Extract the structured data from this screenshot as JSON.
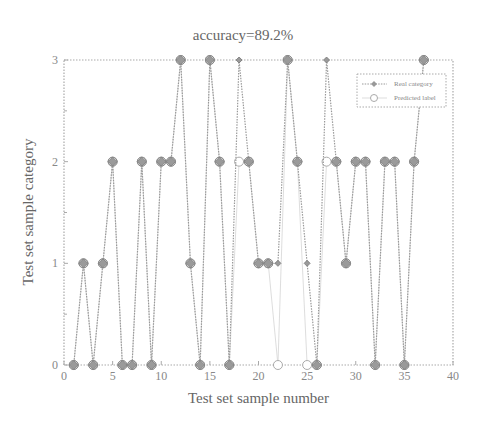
{
  "chart_data": {
    "type": "line",
    "title": "accuracy=89.2%",
    "xlabel": "Test set sample number",
    "ylabel": "Test set sample category",
    "xlim": [
      0,
      40
    ],
    "ylim": [
      0,
      3
    ],
    "xticks": [
      0,
      5,
      10,
      15,
      20,
      25,
      30,
      35,
      40
    ],
    "yticks": [
      0,
      1,
      2,
      3
    ],
    "grid": false,
    "legend_position": "upper right",
    "x": [
      1,
      2,
      3,
      4,
      5,
      6,
      7,
      8,
      9,
      10,
      11,
      12,
      13,
      14,
      15,
      16,
      17,
      18,
      19,
      20,
      21,
      22,
      23,
      24,
      25,
      26,
      27,
      28,
      29,
      30,
      31,
      32,
      33,
      34,
      35,
      36,
      37
    ],
    "series": [
      {
        "name": "Real category",
        "style": "dotted line with diamond markers",
        "values": [
          0,
          1,
          0,
          1,
          2,
          0,
          0,
          2,
          0,
          2,
          2,
          3,
          1,
          0,
          3,
          2,
          0,
          3,
          2,
          1,
          1,
          1,
          3,
          2,
          1,
          0,
          3,
          2,
          1,
          2,
          2,
          0,
          2,
          2,
          0,
          2,
          3
        ]
      },
      {
        "name": "Predicted label",
        "style": "solid line with circle markers",
        "values": [
          0,
          1,
          0,
          1,
          2,
          0,
          0,
          2,
          0,
          2,
          2,
          3,
          1,
          0,
          3,
          2,
          0,
          2,
          2,
          1,
          1,
          0,
          3,
          2,
          0,
          0,
          2,
          2,
          1,
          2,
          2,
          0,
          2,
          2,
          0,
          2,
          3
        ]
      }
    ],
    "colors": {
      "real": "#999999",
      "predicted": "#bbbbbb",
      "axis": "#aaaaaa"
    }
  }
}
